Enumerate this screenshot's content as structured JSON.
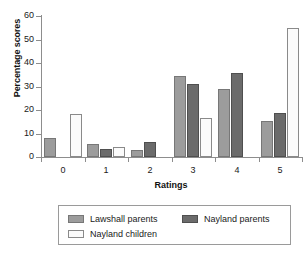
{
  "chart_data": {
    "type": "bar",
    "title": "",
    "subtitle": "",
    "xlabel": "Ratings",
    "ylabel": "Percentage scores",
    "categories": [
      "0",
      "1",
      "2",
      "3",
      "4",
      "5"
    ],
    "ylim": [
      0,
      60
    ],
    "yticks": [
      0,
      10,
      20,
      30,
      40,
      50,
      60
    ],
    "ytick_labels": [
      "0",
      "10",
      "20",
      "30",
      "40",
      "50",
      "60"
    ],
    "grid": false,
    "legend_position": "bottom",
    "series": [
      {
        "name": "Lawshall parents",
        "color": "#9c9c9c",
        "values": [
          8.2,
          5.5,
          3.0,
          34.3,
          29.0,
          15.4
        ]
      },
      {
        "name": "Nayland parents",
        "color": "#6b6b6b",
        "values": [
          0,
          3.5,
          6.3,
          31.2,
          35.6,
          18.9
        ]
      },
      {
        "name": "Nayland children",
        "color": "#fbfbfb",
        "values": [
          18.2,
          4.1,
          0,
          16.8,
          0,
          55.0
        ]
      }
    ]
  }
}
